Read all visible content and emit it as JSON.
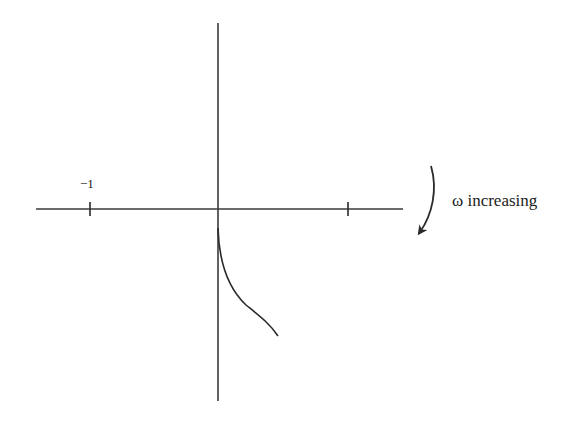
{
  "diagram": {
    "type": "nyquist-plot",
    "colors": {
      "line": "#2a2a2a",
      "background": "#ffffff"
    },
    "axes": {
      "real": {
        "x1": 36,
        "x2": 403,
        "y": 209
      },
      "imag": {
        "x": 218,
        "y1": 23,
        "y2": 401
      },
      "ticks": [
        {
          "x": 90,
          "label": "−1"
        },
        {
          "x": 348,
          "label": ""
        }
      ]
    },
    "curve_path": "M 218 228 C 219 262, 228 288, 246 305 C 262 318, 270 324, 278 336",
    "annotation": {
      "direction_label": "ω increasing",
      "arrow_path": "M 431 166 C 438 190, 432 215, 420 232"
    }
  }
}
